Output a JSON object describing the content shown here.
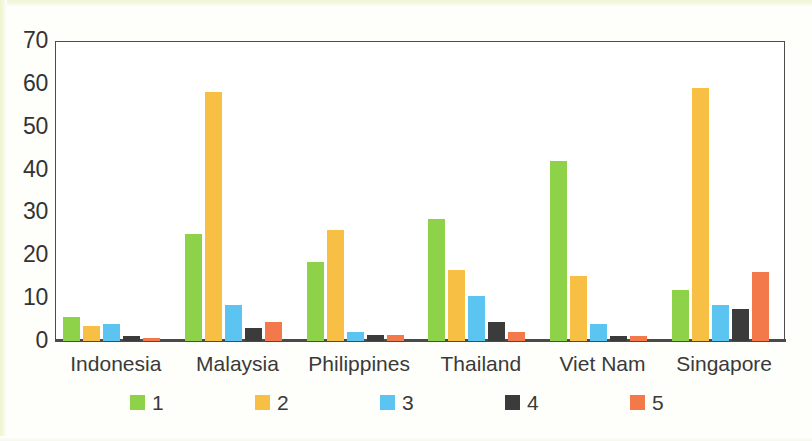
{
  "chart_data": {
    "type": "bar",
    "title": "",
    "subtitle": "",
    "xlabel": "",
    "ylabel": "",
    "ylim": [
      0,
      70
    ],
    "yticks": [
      0,
      10,
      20,
      30,
      40,
      50,
      60,
      70
    ],
    "grid": false,
    "legend_position": "bottom",
    "categories": [
      "Indonesia",
      "Malaysia",
      "Philippines",
      "Thailand",
      "Viet Nam",
      "Singapore"
    ],
    "series": [
      {
        "name": "1",
        "color": "#8ed24a",
        "values": [
          5.5,
          25.0,
          18.5,
          28.5,
          42.0,
          12.0
        ]
      },
      {
        "name": "2",
        "color": "#f7c044",
        "values": [
          3.5,
          58.0,
          26.0,
          16.5,
          15.2,
          59.0
        ]
      },
      {
        "name": "3",
        "color": "#5cc4f0",
        "values": [
          4.0,
          8.5,
          2.0,
          10.5,
          4.0,
          8.5
        ]
      },
      {
        "name": "4",
        "color": "#3b3b3b",
        "values": [
          1.2,
          3.0,
          1.3,
          4.5,
          1.2,
          7.5
        ]
      },
      {
        "name": "5",
        "color": "#f3794a",
        "values": [
          0.8,
          4.5,
          1.5,
          2.0,
          1.2,
          16.0
        ]
      }
    ]
  },
  "axis": {
    "y_tick_labels": [
      "0",
      "10",
      "20",
      "30",
      "40",
      "50",
      "60",
      "70"
    ]
  },
  "legend": {
    "items": [
      {
        "label": "1",
        "color": "#8ed24a"
      },
      {
        "label": "2",
        "color": "#f7c044"
      },
      {
        "label": "3",
        "color": "#5cc4f0"
      },
      {
        "label": "4",
        "color": "#3b3b3b"
      },
      {
        "label": "5",
        "color": "#f3794a"
      }
    ]
  }
}
